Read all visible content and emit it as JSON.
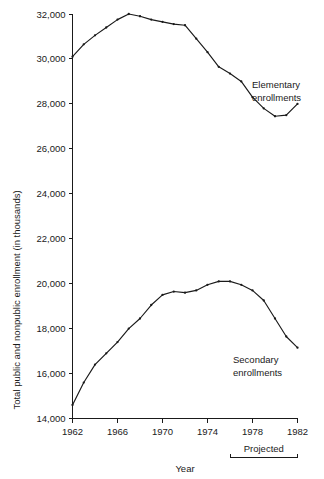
{
  "chart_data": {
    "type": "line",
    "title": "",
    "xlabel": "Year",
    "ylabel": "Total public and nonpublic enrollment (in thousands)",
    "xlim": [
      1962,
      1982
    ],
    "ylim": [
      14000,
      32000
    ],
    "grid": false,
    "legend_position": "inline-annotation",
    "x_ticks": [
      "1962",
      "1966",
      "1970",
      "1974",
      "1978",
      "1982"
    ],
    "x_tick_values": [
      1962,
      1966,
      1970,
      1974,
      1978,
      1982
    ],
    "y_ticks": [
      "14,000",
      "16,000",
      "18,000",
      "20,000",
      "22,000",
      "24,000",
      "26,000",
      "28,000",
      "30,000",
      "32,000"
    ],
    "y_tick_values": [
      14000,
      16000,
      18000,
      20000,
      22000,
      24000,
      26000,
      28000,
      30000,
      32000
    ],
    "x": [
      1962,
      1963,
      1964,
      1965,
      1966,
      1967,
      1968,
      1969,
      1970,
      1971,
      1972,
      1973,
      1974,
      1975,
      1976,
      1977,
      1978,
      1979,
      1980,
      1981,
      1982
    ],
    "series": [
      {
        "name": "Elementary enrollments",
        "label": "Elementary enrollments",
        "values": [
          30100,
          30650,
          31050,
          31400,
          31750,
          32000,
          31900,
          31750,
          31650,
          31550,
          31500,
          30900,
          30300,
          29650,
          29350,
          29000,
          28300,
          27800,
          27450,
          27500,
          28000
        ]
      },
      {
        "name": "Secondary enrollments",
        "label": "Secondary enrollments",
        "values": [
          14600,
          15600,
          16400,
          16900,
          17400,
          18000,
          18450,
          19050,
          19500,
          19650,
          19600,
          19700,
          19950,
          20100,
          20100,
          19950,
          19700,
          19250,
          18450,
          17650,
          17150
        ]
      }
    ],
    "annotations": [
      {
        "name": "projected-bracket",
        "text": "Projected",
        "x_start": 1976,
        "x_end": 1982
      }
    ]
  },
  "labels": {
    "y_axis_title": "Total public and nonpublic enrollment (in thousands)",
    "x_axis_title": "Year",
    "elementary_line1": "Elementary",
    "elementary_line2": "enrollments",
    "secondary_line1": "Secondary",
    "secondary_line2": "enrollments",
    "projected": "Projected"
  },
  "y_tick_labels": [
    "32,000",
    "30,000",
    "28,000",
    "26,000",
    "24,000",
    "22,000",
    "20,000",
    "18,000",
    "16,000",
    "14,000"
  ],
  "x_tick_labels": [
    "1962",
    "1966",
    "1970",
    "1974",
    "1978",
    "1982"
  ],
  "colors": {
    "background": "#ffffff",
    "ink": "#1a1a1a",
    "line": "#1a1a1a"
  }
}
